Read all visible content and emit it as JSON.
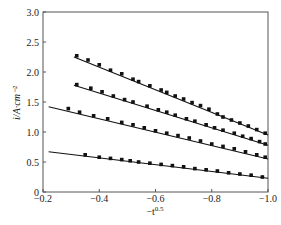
{
  "chart_data": {
    "type": "scatter",
    "title": "",
    "xlabel": "-t^0.5",
    "xlabel_base": "−t",
    "xlabel_sup": "0.5",
    "ylabel": "i/A·cm⁻²",
    "xlim": [
      -0.2,
      -1.0
    ],
    "ylim": [
      0,
      3.0
    ],
    "x_ticks": [
      -0.2,
      -0.4,
      -0.6,
      -0.8,
      -1.0
    ],
    "x_tick_labels": [
      "−0.2",
      "−0.4",
      "−0.6",
      "−0.8",
      "−1.0"
    ],
    "y_ticks": [
      0,
      0.5,
      1.0,
      1.5,
      2.0,
      2.5,
      3.0
    ],
    "y_tick_labels": [
      "0",
      "0.5",
      "1.0",
      "1.5",
      "2.0",
      "2.5",
      "3.0"
    ],
    "grid": false,
    "legend": null,
    "series": [
      {
        "name": "series 1",
        "fit_line": [
          [
            -0.31,
            2.25
          ],
          [
            -1.0,
            0.95
          ]
        ],
        "points": [
          [
            -0.32,
            2.27
          ],
          [
            -0.36,
            2.2
          ],
          [
            -0.4,
            2.12
          ],
          [
            -0.44,
            2.03
          ],
          [
            -0.48,
            1.97
          ],
          [
            -0.52,
            1.88
          ],
          [
            -0.54,
            1.84
          ],
          [
            -0.58,
            1.77
          ],
          [
            -0.62,
            1.7
          ],
          [
            -0.64,
            1.66
          ],
          [
            -0.67,
            1.6
          ],
          [
            -0.7,
            1.55
          ],
          [
            -0.73,
            1.49
          ],
          [
            -0.76,
            1.44
          ],
          [
            -0.79,
            1.38
          ],
          [
            -0.82,
            1.3
          ],
          [
            -0.84,
            1.25
          ],
          [
            -0.87,
            1.2
          ],
          [
            -0.9,
            1.15
          ],
          [
            -0.93,
            1.1
          ],
          [
            -0.96,
            1.04
          ],
          [
            -0.99,
            0.98
          ]
        ]
      },
      {
        "name": "series 2",
        "fit_line": [
          [
            -0.31,
            1.78
          ],
          [
            -1.0,
            0.78
          ]
        ],
        "points": [
          [
            -0.32,
            1.79
          ],
          [
            -0.37,
            1.73
          ],
          [
            -0.41,
            1.67
          ],
          [
            -0.45,
            1.6
          ],
          [
            -0.49,
            1.54
          ],
          [
            -0.52,
            1.5
          ],
          [
            -0.57,
            1.43
          ],
          [
            -0.61,
            1.37
          ],
          [
            -0.64,
            1.33
          ],
          [
            -0.67,
            1.28
          ],
          [
            -0.71,
            1.22
          ],
          [
            -0.74,
            1.18
          ],
          [
            -0.78,
            1.12
          ],
          [
            -0.81,
            1.07
          ],
          [
            -0.84,
            1.03
          ],
          [
            -0.88,
            0.98
          ],
          [
            -0.91,
            0.93
          ],
          [
            -0.94,
            0.89
          ],
          [
            -0.97,
            0.84
          ],
          [
            -0.99,
            0.8
          ]
        ]
      },
      {
        "name": "series 3",
        "fit_line": [
          [
            -0.22,
            1.42
          ],
          [
            -1.0,
            0.55
          ]
        ],
        "points": [
          [
            -0.29,
            1.39
          ],
          [
            -0.33,
            1.33
          ],
          [
            -0.38,
            1.27
          ],
          [
            -0.43,
            1.22
          ],
          [
            -0.48,
            1.16
          ],
          [
            -0.52,
            1.12
          ],
          [
            -0.56,
            1.07
          ],
          [
            -0.6,
            1.02
          ],
          [
            -0.64,
            0.98
          ],
          [
            -0.68,
            0.94
          ],
          [
            -0.72,
            0.9
          ],
          [
            -0.76,
            0.85
          ],
          [
            -0.8,
            0.8
          ],
          [
            -0.84,
            0.76
          ],
          [
            -0.88,
            0.72
          ],
          [
            -0.92,
            0.67
          ],
          [
            -0.96,
            0.62
          ],
          [
            -0.99,
            0.58
          ]
        ]
      },
      {
        "name": "series 4",
        "fit_line": [
          [
            -0.22,
            0.67
          ],
          [
            -1.0,
            0.23
          ]
        ],
        "points": [
          [
            -0.35,
            0.62
          ],
          [
            -0.4,
            0.58
          ],
          [
            -0.44,
            0.56
          ],
          [
            -0.48,
            0.54
          ],
          [
            -0.51,
            0.52
          ],
          [
            -0.54,
            0.5
          ],
          [
            -0.58,
            0.48
          ],
          [
            -0.62,
            0.46
          ],
          [
            -0.66,
            0.44
          ],
          [
            -0.7,
            0.42
          ],
          [
            -0.74,
            0.39
          ],
          [
            -0.78,
            0.37
          ],
          [
            -0.82,
            0.35
          ],
          [
            -0.86,
            0.32
          ],
          [
            -0.9,
            0.3
          ],
          [
            -0.94,
            0.28
          ],
          [
            -0.98,
            0.25
          ]
        ]
      }
    ]
  }
}
